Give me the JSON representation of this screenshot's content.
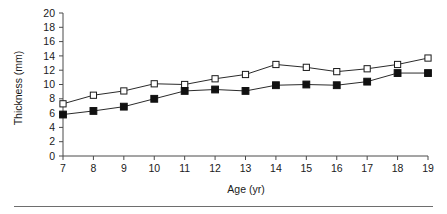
{
  "chart_data": {
    "type": "line",
    "title": "",
    "xlabel": "Age (yr)",
    "ylabel": "Thickness (mm)",
    "x": [
      7,
      8,
      9,
      10,
      11,
      12,
      13,
      14,
      15,
      16,
      17,
      18,
      19
    ],
    "xtick_labels": [
      "7",
      "8",
      "9",
      "10",
      "11",
      "12",
      "13",
      "14",
      "15",
      "16",
      "17",
      "18",
      "19"
    ],
    "ytick_labels": [
      "0",
      "2",
      "4",
      "6",
      "8",
      "10",
      "12",
      "14",
      "16",
      "18",
      "20"
    ],
    "yticks": [
      0,
      2,
      4,
      6,
      8,
      10,
      12,
      14,
      16,
      18,
      20
    ],
    "xlim": [
      7,
      19
    ],
    "ylim": [
      0,
      20
    ],
    "grid": false,
    "legend": "none",
    "series": [
      {
        "name": "open-square-series",
        "marker": "open-square",
        "values": [
          7.3,
          8.5,
          9.1,
          10.1,
          10.0,
          10.8,
          11.4,
          12.8,
          12.4,
          11.8,
          12.2,
          12.8,
          13.7
        ]
      },
      {
        "name": "filled-square-series",
        "marker": "filled-square",
        "values": [
          5.8,
          6.3,
          6.9,
          8.0,
          9.1,
          9.3,
          9.1,
          9.9,
          10.0,
          9.9,
          10.4,
          11.6,
          11.6
        ]
      }
    ]
  },
  "figure": {
    "background_color": "#ffffff",
    "line_color": "#2b2b2b",
    "axis_color": "#4a4a4a",
    "footer_rule_color": "#6e6e6e"
  }
}
